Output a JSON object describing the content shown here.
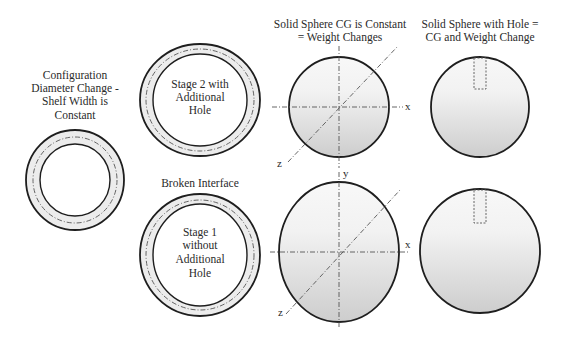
{
  "labels": {
    "config_title": [
      "Configuration",
      "Diameter Change -",
      "Shelf Width is",
      "Constant"
    ],
    "stage2_text": [
      "Stage 2 with",
      "Additional",
      "Hole"
    ],
    "broken_interface": "Broken Interface",
    "stage1_text": [
      "Stage 1",
      "without",
      "Additional",
      "Hole"
    ],
    "solid_sphere_title": [
      "Solid Sphere CG is Constant",
      "= Weight Changes"
    ],
    "hole_sphere_title": [
      "Solid Sphere with Hole =",
      "CG and Weight Change"
    ]
  },
  "axes": {
    "x_label": "x",
    "y_label": "y",
    "z_label": "z"
  },
  "colors": {
    "ring_fill": "#ececec",
    "sphere_top": "#f7f7f7",
    "sphere_bottom": "#cfcfcf",
    "outline": "#1e1e1e"
  }
}
